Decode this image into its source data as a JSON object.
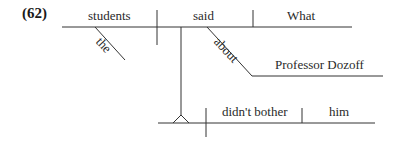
{
  "example_number": "(62)",
  "diagram": {
    "main_clause": {
      "subject": "students",
      "subject_modifier": "the",
      "verb": "said",
      "direct_object": "What",
      "prepositional_phrase": {
        "preposition": "about",
        "object": "Professor Dozoff"
      }
    },
    "subordinate_clause": {
      "subject": "",
      "verb": "didn't bother",
      "direct_object": "him"
    }
  },
  "colors": {
    "line": "#333333",
    "text": "#2a2a2a"
  }
}
